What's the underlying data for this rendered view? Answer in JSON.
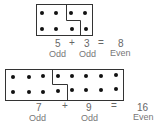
{
  "diagrams": [
    {
      "equation": {
        "a": "5",
        "op": "+",
        "b": "3",
        "eq": "=",
        "sum": "8"
      },
      "labels": {
        "a": "Odd",
        "b": "Odd",
        "sum": "Even"
      }
    },
    {
      "equation": {
        "a": "7",
        "op": "+",
        "b": "9",
        "eq": "=",
        "sum": "16"
      },
      "labels": {
        "a": "Odd",
        "b": "Odd",
        "sum": "Even"
      }
    }
  ]
}
